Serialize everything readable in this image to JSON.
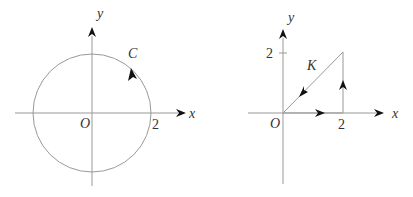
{
  "left_figure": {
    "axis_x_label": "x",
    "axis_y_label": "y",
    "origin_label": "O",
    "tick_x_label": "2",
    "curve_label": "C",
    "curve": "circle centered at origin, radius 2, counterclockwise"
  },
  "right_figure": {
    "axis_x_label": "x",
    "axis_y_label": "y",
    "origin_label": "O",
    "tick_x_label": "2",
    "tick_y_label": "2",
    "curve_label": "K",
    "curve": "triangle (0,0)->(2,0)->(2,2)->(0,0)"
  },
  "colors": {
    "line": "#999999",
    "arrow": "#111111",
    "text": "#333333"
  }
}
